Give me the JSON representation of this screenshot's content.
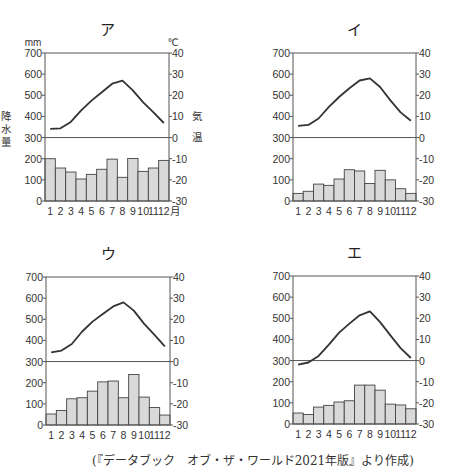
{
  "source_caption": "(『データブック　オブ・ザ・ワールド2021年版』より作成)",
  "axis_labels": {
    "left_unit": "mm",
    "right_unit": "℃",
    "left_name_chars": [
      "降",
      "水",
      "量"
    ],
    "right_name_chars": [
      "気",
      "温"
    ],
    "month_suffix": "月"
  },
  "colors": {
    "bar_fill": "#d9d9d9",
    "bar_stroke": "#444444",
    "line": "#333333",
    "axis": "#555555"
  },
  "chart_data": [
    {
      "type": "bar+line",
      "title": "ア",
      "categories": [
        "1",
        "2",
        "3",
        "4",
        "5",
        "6",
        "7",
        "8",
        "9",
        "10",
        "11",
        "12"
      ],
      "series": [
        {
          "name": "降水量 (mm)",
          "kind": "bar",
          "axis": "left",
          "values": [
            200,
            156,
            137,
            104,
            126,
            150,
            198,
            112,
            201,
            140,
            156,
            192
          ]
        },
        {
          "name": "気温 (℃)",
          "kind": "line",
          "axis": "right",
          "values": [
            4.1,
            4.4,
            7.4,
            12.9,
            17.5,
            21.4,
            25.5,
            26.9,
            22.3,
            16.7,
            11.9,
            6.9
          ]
        }
      ],
      "left_ticks": [
        0,
        100,
        200,
        300,
        400,
        500,
        600,
        700
      ],
      "right_ticks": [
        -30,
        -20,
        -10,
        0,
        10,
        20,
        30,
        40
      ],
      "ylim_left": [
        0,
        700
      ],
      "ylim_right": [
        -30,
        40
      ],
      "show_units": true,
      "show_axis_names": true,
      "month_suffix": true
    },
    {
      "type": "bar+line",
      "title": "イ",
      "categories": [
        "1",
        "2",
        "3",
        "4",
        "5",
        "6",
        "7",
        "8",
        "9",
        "10",
        "11",
        "12"
      ],
      "series": [
        {
          "name": "降水量 (mm)",
          "kind": "bar",
          "axis": "left",
          "values": [
            36,
            46,
            80,
            74,
            104,
            148,
            142,
            83,
            145,
            100,
            58,
            36
          ]
        },
        {
          "name": "気温 (℃)",
          "kind": "line",
          "axis": "right",
          "values": [
            5.5,
            6.0,
            9.0,
            14.5,
            19.2,
            23.3,
            27.0,
            28.0,
            23.9,
            17.6,
            11.9,
            8.0
          ]
        }
      ],
      "left_ticks": [
        0,
        100,
        200,
        300,
        400,
        500,
        600,
        700
      ],
      "right_ticks": [
        -30,
        -20,
        -10,
        0,
        10,
        20,
        30,
        40
      ],
      "ylim_left": [
        0,
        700
      ],
      "ylim_right": [
        -30,
        40
      ],
      "show_units": false,
      "show_axis_names": false,
      "month_suffix": false
    },
    {
      "type": "bar+line",
      "title": "ウ",
      "categories": [
        "1",
        "2",
        "3",
        "4",
        "5",
        "6",
        "7",
        "8",
        "9",
        "10",
        "11",
        "12"
      ],
      "series": [
        {
          "name": "降水量 (mm)",
          "kind": "bar",
          "axis": "left",
          "values": [
            52,
            69,
            124,
            129,
            160,
            204,
            208,
            129,
            239,
            132,
            83,
            47
          ]
        },
        {
          "name": "気温 (℃)",
          "kind": "line",
          "axis": "right",
          "values": [
            4.4,
            5.2,
            8.3,
            14.2,
            18.9,
            22.5,
            26.1,
            28.0,
            24.1,
            17.8,
            12.6,
            7.2
          ]
        }
      ],
      "left_ticks": [
        0,
        100,
        200,
        300,
        400,
        500,
        600,
        700
      ],
      "right_ticks": [
        -30,
        -20,
        -10,
        0,
        10,
        20,
        30,
        40
      ],
      "ylim_left": [
        0,
        700
      ],
      "ylim_right": [
        -30,
        40
      ],
      "show_units": false,
      "show_axis_names": false,
      "month_suffix": false
    },
    {
      "type": "bar+line",
      "title": "エ",
      "categories": [
        "1",
        "2",
        "3",
        "4",
        "5",
        "6",
        "7",
        "8",
        "9",
        "10",
        "11",
        "12"
      ],
      "series": [
        {
          "name": "降水量 (mm)",
          "kind": "bar",
          "axis": "left",
          "values": [
            52,
            45,
            80,
            88,
            104,
            110,
            184,
            184,
            160,
            94,
            90,
            72
          ]
        },
        {
          "name": "気温 (℃)",
          "kind": "line",
          "axis": "right",
          "values": [
            -1.9,
            -0.9,
            2.2,
            7.5,
            13.2,
            17.5,
            21.4,
            23.3,
            18.2,
            11.9,
            5.9,
            1.2
          ]
        }
      ],
      "left_ticks": [
        0,
        100,
        200,
        300,
        400,
        500,
        600,
        700
      ],
      "right_ticks": [
        -30,
        -20,
        -10,
        0,
        10,
        20,
        30,
        40
      ],
      "ylim_left": [
        0,
        700
      ],
      "ylim_right": [
        -30,
        40
      ],
      "show_units": false,
      "show_axis_names": false,
      "month_suffix": false
    }
  ]
}
